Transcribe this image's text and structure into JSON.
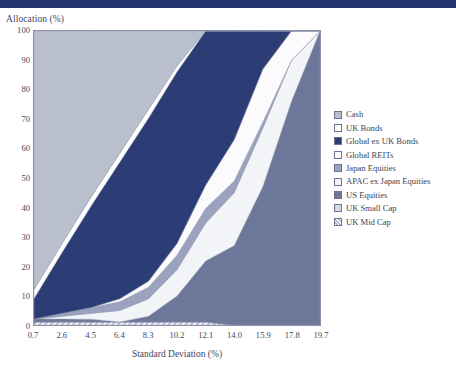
{
  "header": {
    "bar_color": "#22356f"
  },
  "axes": {
    "y_title": "Allocation (%)",
    "x_title": "Standard Deviation (%)",
    "y_ticks": [
      "100",
      "90",
      "80",
      "70",
      "60",
      "50",
      "40",
      "30",
      "20",
      "10",
      "0"
    ],
    "x_ticks": [
      "0.7",
      "2.6",
      "4.5",
      "6.4",
      "8.3",
      "10.2",
      "12.1",
      "14.0",
      "15.9",
      "17.8",
      "19.7"
    ]
  },
  "legend": {
    "items": [
      {
        "label": "Cash",
        "color": "#b9bfcc"
      },
      {
        "label": "UK Bonds",
        "color": "#ffffff"
      },
      {
        "label": "Global ex UK Bonds",
        "color": "#2b3d74"
      },
      {
        "label": "Global REITs",
        "color": "#fbfbfd"
      },
      {
        "label": "Japan Equities",
        "color": "#9aa2bd"
      },
      {
        "label": "APAC ex Japan Equities",
        "color": "#f2f4f8"
      },
      {
        "label": "US Equities",
        "color": "#6c7799"
      },
      {
        "label": "UK Small Cap",
        "color": "#d7dae3"
      },
      {
        "label": "UK Mid Cap",
        "color": "#aeb6cc"
      }
    ]
  },
  "chart_data": {
    "type": "area",
    "title": "",
    "xlabel": "Standard Deviation (%)",
    "ylabel": "Allocation (%)",
    "xlim": [
      0.7,
      19.7
    ],
    "ylim": [
      0,
      100
    ],
    "grid": false,
    "legend_position": "right",
    "stacked": true,
    "x": [
      0.7,
      2.6,
      4.5,
      6.4,
      8.3,
      10.2,
      12.1,
      14.0,
      15.9,
      17.8,
      19.7
    ],
    "series": [
      {
        "name": "Cash",
        "color": "#b9bfcc",
        "values": [
          88,
          72,
          57,
          42,
          27,
          12,
          0,
          0,
          0,
          0,
          0
        ]
      },
      {
        "name": "UK Bonds",
        "color": "#ffffff",
        "values": [
          3,
          3,
          3,
          3,
          3,
          2,
          0,
          0,
          0,
          0,
          0
        ]
      },
      {
        "name": "Global ex UK Bonds",
        "color": "#2b3d74",
        "values": [
          7,
          21,
          35,
          47,
          56,
          59,
          53,
          37,
          13,
          0,
          0
        ]
      },
      {
        "name": "Global REITs",
        "color": "#fbfbfd",
        "values": [
          0,
          0,
          0,
          1,
          2,
          4,
          8,
          14,
          18,
          10,
          0
        ]
      },
      {
        "name": "Japan Equities",
        "color": "#9aa2bd",
        "values": [
          0,
          1,
          2,
          3,
          4,
          5,
          5,
          4,
          2,
          0,
          0
        ]
      },
      {
        "name": "APAC ex Japan Equities",
        "color": "#f2f4f8",
        "values": [
          0,
          1,
          2,
          4,
          6,
          9,
          13,
          18,
          20,
          14,
          0
        ]
      },
      {
        "name": "US Equities",
        "color": "#6c7799",
        "values": [
          1,
          1,
          1,
          0,
          2,
          9,
          21,
          27,
          47,
          76,
          100
        ]
      },
      {
        "name": "UK Small Cap",
        "color": "#d7dae3",
        "values": [
          0,
          0,
          0,
          0,
          0,
          0,
          0,
          0,
          0,
          0,
          0
        ]
      },
      {
        "name": "UK Mid Cap",
        "color": "#aeb6cc",
        "values": [
          1,
          1,
          1,
          1,
          1,
          1,
          1,
          0,
          0,
          0,
          0
        ]
      }
    ],
    "annotations": [
      {
        "text": "peak of Global REITs / APAC band",
        "x": 15.9,
        "y": 87
      }
    ]
  }
}
